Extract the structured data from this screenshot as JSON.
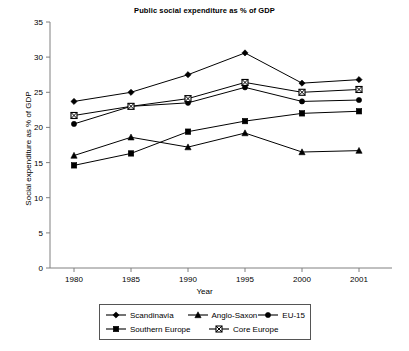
{
  "chart_data": {
    "type": "line",
    "title": "Public social expenditure as % of GDP",
    "xlabel": "Year",
    "ylabel": "Social expenditure as % of GDP",
    "categories": [
      "1980",
      "1985",
      "1990",
      "1995",
      "2000",
      "2001"
    ],
    "ylim": [
      0,
      35
    ],
    "yticks": [
      "0",
      "5",
      "10",
      "15",
      "20",
      "25",
      "30",
      "35"
    ],
    "grid": false,
    "legend_position": "bottom",
    "series": [
      {
        "name": "Scandinavia",
        "marker": "diamond",
        "values": [
          23.7,
          25.0,
          27.5,
          30.6,
          26.3,
          26.8
        ]
      },
      {
        "name": "Anglo-Saxon",
        "marker": "triangle",
        "values": [
          16.0,
          18.6,
          17.2,
          19.2,
          16.5,
          16.7
        ]
      },
      {
        "name": "EU-15",
        "marker": "circle",
        "values": [
          20.5,
          23.0,
          23.5,
          25.7,
          23.7,
          23.9
        ]
      },
      {
        "name": "Southern Europe",
        "marker": "square",
        "values": [
          14.6,
          16.3,
          19.4,
          20.9,
          22.0,
          22.3
        ]
      },
      {
        "name": "Core Europe",
        "marker": "crossed-square",
        "values": [
          21.7,
          23.0,
          24.1,
          26.4,
          25.0,
          25.4
        ]
      }
    ]
  },
  "legend": {
    "items": [
      {
        "label": "Scandinavia",
        "marker": "diamond-marker-icon"
      },
      {
        "label": "Anglo-Saxon",
        "marker": "triangle-marker-icon"
      },
      {
        "label": "EU-15",
        "marker": "circle-marker-icon"
      },
      {
        "label": "Southern Europe",
        "marker": "square-marker-icon"
      },
      {
        "label": "Core Europe",
        "marker": "crossed-square-marker-icon"
      }
    ]
  },
  "colors": {
    "series": "#000000",
    "axis": "#808080",
    "legend_border": "#555555",
    "background": "#ffffff"
  }
}
